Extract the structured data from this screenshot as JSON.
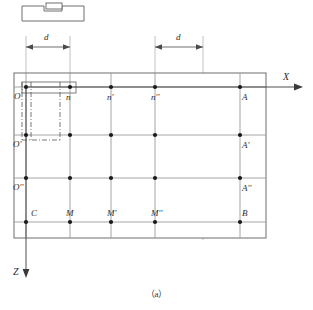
{
  "figure": {
    "caption": "（a）",
    "axes": {
      "x_label": "X",
      "z_label": "Z"
    },
    "dimensions": [
      {
        "label": "d",
        "from": "O",
        "to": "n"
      },
      {
        "label": "d",
        "from": "n''",
        "to": "right-edge"
      }
    ],
    "grid": {
      "columns": 5,
      "rows": 4,
      "col_x": [
        26,
        70,
        111,
        155,
        240
      ],
      "row_y": [
        87,
        135,
        178,
        222
      ],
      "outer_left": 14,
      "outer_right": 266,
      "outer_top": 73,
      "outer_bottom": 238
    },
    "point_labels": {
      "row1": [
        "O",
        "n",
        "n'",
        "n''",
        "A"
      ],
      "row2": [
        "O'",
        "",
        "",
        "",
        "A'"
      ],
      "row3": [
        "O''",
        "",
        "",
        "",
        "A''"
      ],
      "row4": [
        "C",
        "M",
        "M'",
        "M''",
        "B"
      ]
    },
    "tool_icon": {
      "name": "workpiece-tool-profile"
    },
    "highlight": {
      "name": "tool-pass-region",
      "note": "thin rectangle spanning O to n on the first row"
    }
  }
}
